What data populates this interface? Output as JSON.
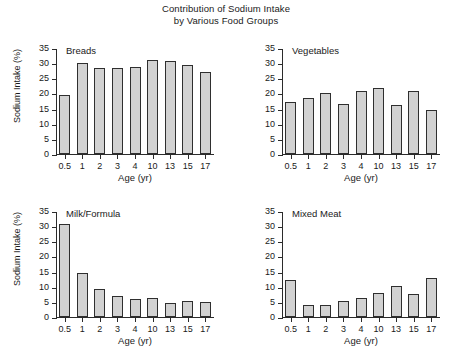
{
  "chart_data": {
    "type": "bar",
    "title": "Contribution of Sodium Intake by Various Food Groups",
    "title_line1": "Contribution of Sodium Intake",
    "title_line2": "by Various Food Groups",
    "categories": [
      "0.5",
      "1",
      "2",
      "3",
      "4",
      "10",
      "13",
      "15",
      "17"
    ],
    "xlabel": "Age (yr)",
    "ylabel": "Sodium Intake (%)",
    "ylim": [
      0,
      35
    ],
    "yticks": [
      0,
      5,
      10,
      15,
      20,
      25,
      30,
      35
    ],
    "grid": false,
    "legend": "none",
    "panels": [
      {
        "name": "Breads",
        "show_ylabel": true,
        "values": [
          19.6,
          30.0,
          28.3,
          28.5,
          28.7,
          31.0,
          30.7,
          29.4,
          27.0
        ]
      },
      {
        "name": "Vegetables",
        "show_ylabel": false,
        "values": [
          17.2,
          18.5,
          20.0,
          16.6,
          20.8,
          21.8,
          16.3,
          20.8,
          14.4
        ]
      },
      {
        "name": "Milk/Formula",
        "show_ylabel": true,
        "values": [
          30.8,
          14.4,
          9.2,
          6.8,
          6.1,
          6.4,
          4.5,
          5.2,
          4.9
        ]
      },
      {
        "name": "Mixed Meat",
        "show_ylabel": false,
        "values": [
          12.3,
          4.0,
          3.9,
          5.2,
          6.3,
          7.8,
          10.2,
          7.5,
          12.9
        ]
      }
    ],
    "colors": {
      "bar_fill": "#d2d2d2",
      "bar_edge": "#2f2f2f",
      "axis": "#2b2b2b",
      "text": "#1a1a1a",
      "background": "#ffffff"
    }
  }
}
